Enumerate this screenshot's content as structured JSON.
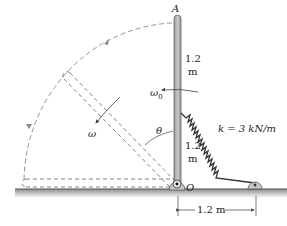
{
  "figure": {
    "point_top": "A",
    "point_pivot": "O",
    "upper_length": "1.2",
    "upper_length_unit": "m",
    "lower_length": "1.2",
    "lower_length_unit": "m",
    "initial_angular_velocity": "ω",
    "initial_angular_velocity_sub": "0",
    "angular_velocity": "ω",
    "angle": "θ",
    "spring_label": "k = 3 kN/m",
    "base_distance": "1.2 m"
  },
  "colors": {
    "bar_fill": "#b9b9b9",
    "bar_stroke": "#555555",
    "ground": "#8a8a8a",
    "dashed": "#777777",
    "ink": "#222222"
  }
}
